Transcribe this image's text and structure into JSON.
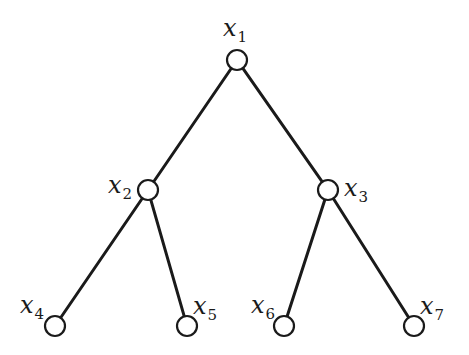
{
  "diagram": {
    "type": "binary-tree",
    "nodes": [
      {
        "id": "x1",
        "var": "x",
        "sub": "1",
        "cx": 237,
        "cy": 60,
        "label_x": 223,
        "label_y": 16
      },
      {
        "id": "x2",
        "var": "x",
        "sub": "2",
        "cx": 148,
        "cy": 190,
        "label_x": 108,
        "label_y": 173
      },
      {
        "id": "x3",
        "var": "x",
        "sub": "3",
        "cx": 328,
        "cy": 190,
        "label_x": 344,
        "label_y": 176
      },
      {
        "id": "x4",
        "var": "x",
        "sub": "4",
        "cx": 55,
        "cy": 326,
        "label_x": 20,
        "label_y": 293
      },
      {
        "id": "x5",
        "var": "x",
        "sub": "5",
        "cx": 187,
        "cy": 326,
        "label_x": 193,
        "label_y": 294
      },
      {
        "id": "x6",
        "var": "x",
        "sub": "6",
        "cx": 284,
        "cy": 326,
        "label_x": 251,
        "label_y": 293
      },
      {
        "id": "x7",
        "var": "x",
        "sub": "7",
        "cx": 414,
        "cy": 326,
        "label_x": 420,
        "label_y": 294
      }
    ],
    "edges": [
      {
        "from": "x1",
        "to": "x2"
      },
      {
        "from": "x1",
        "to": "x3"
      },
      {
        "from": "x2",
        "to": "x4"
      },
      {
        "from": "x2",
        "to": "x5"
      },
      {
        "from": "x3",
        "to": "x6"
      },
      {
        "from": "x3",
        "to": "x7"
      }
    ],
    "node_radius": 10,
    "colors": {
      "stroke": "#1a1a1a",
      "node_fill": "#ffffff",
      "background": "#ffffff"
    }
  }
}
